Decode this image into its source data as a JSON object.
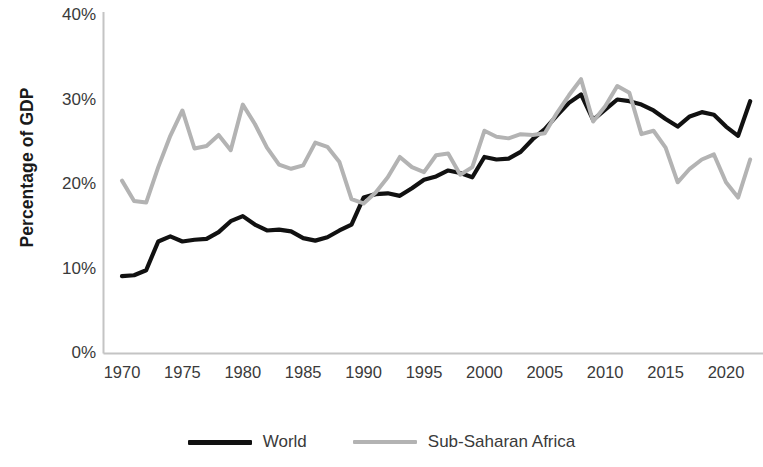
{
  "chart_data": {
    "type": "line",
    "title": "",
    "xlabel": "",
    "ylabel": "Percentage of GDP",
    "xlim": [
      1970,
      2022
    ],
    "ylim": [
      0,
      40
    ],
    "y_tick_labels": [
      "40%",
      "30%",
      "20%",
      "10%",
      "0%"
    ],
    "y_tick_values": [
      40,
      30,
      20,
      10,
      0
    ],
    "x_tick_labels": [
      "1970",
      "1975",
      "1980",
      "1985",
      "1990",
      "1995",
      "2000",
      "2005",
      "2010",
      "2015",
      "2020"
    ],
    "x_tick_values": [
      1970,
      1975,
      1980,
      1985,
      1990,
      1995,
      2000,
      2005,
      2010,
      2015,
      2020
    ],
    "grid": false,
    "legend_position": "bottom",
    "x": [
      1970,
      1971,
      1972,
      1973,
      1974,
      1975,
      1976,
      1977,
      1978,
      1979,
      1980,
      1981,
      1982,
      1983,
      1984,
      1985,
      1986,
      1987,
      1988,
      1989,
      1990,
      1991,
      1992,
      1993,
      1994,
      1995,
      1996,
      1997,
      1998,
      1999,
      2000,
      2001,
      2002,
      2003,
      2004,
      2005,
      2006,
      2007,
      2008,
      2009,
      2010,
      2011,
      2012,
      2013,
      2014,
      2015,
      2016,
      2017,
      2018,
      2019,
      2020,
      2021,
      2022
    ],
    "series": [
      {
        "name": "World",
        "color": "#111111",
        "values": [
          9.1,
          9.2,
          9.8,
          13.2,
          13.8,
          13.2,
          13.4,
          13.5,
          14.3,
          15.6,
          16.2,
          15.2,
          14.5,
          14.6,
          14.4,
          13.6,
          13.3,
          13.7,
          14.5,
          15.2,
          18.4,
          18.8,
          18.9,
          18.6,
          19.5,
          20.5,
          20.9,
          21.6,
          21.3,
          20.8,
          23.2,
          22.9,
          23.0,
          23.8,
          25.3,
          26.5,
          28.1,
          29.6,
          30.6,
          27.6,
          28.8,
          30.0,
          29.8,
          29.4,
          28.7,
          27.7,
          26.8,
          28.0,
          28.5,
          28.2,
          26.8,
          25.7,
          29.8
        ]
      },
      {
        "name": "Sub-Saharan Africa",
        "color": "#b3b3b3",
        "values": [
          20.4,
          18.0,
          17.8,
          22.0,
          25.7,
          28.7,
          24.2,
          24.5,
          25.8,
          24.0,
          29.4,
          27.1,
          24.3,
          22.3,
          21.8,
          22.2,
          24.9,
          24.4,
          22.6,
          18.2,
          17.7,
          19.0,
          20.8,
          23.2,
          22.0,
          21.4,
          23.4,
          23.6,
          21.1,
          22.0,
          26.3,
          25.6,
          25.4,
          25.9,
          25.8,
          26.0,
          28.4,
          30.5,
          32.4,
          27.4,
          29.2,
          31.6,
          30.8,
          25.9,
          26.3,
          24.3,
          20.2,
          21.8,
          22.9,
          23.5,
          20.2,
          18.4,
          22.9
        ]
      }
    ]
  },
  "legend": {
    "items": [
      {
        "label": "World",
        "color": "#111111"
      },
      {
        "label": "Sub-Saharan Africa",
        "color": "#b3b3b3"
      }
    ]
  },
  "axis": {
    "line_color": "#c4c4c4"
  }
}
